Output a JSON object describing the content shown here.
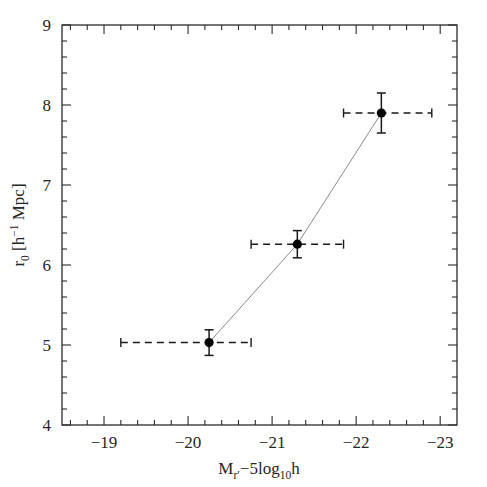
{
  "chart_data": {
    "type": "scatter",
    "title": "",
    "xlabel": "M_r' - 5log10 h",
    "ylabel": "r_0 [h^-1 Mpc]",
    "xlim": [
      -18.5,
      -23.2
    ],
    "ylim": [
      4,
      9
    ],
    "x_ticks": [
      -19,
      -20,
      -21,
      -22,
      -23
    ],
    "x_tick_labels": [
      "−19",
      "−20",
      "−21",
      "−22",
      "−23"
    ],
    "y_ticks": [
      4,
      5,
      6,
      7,
      8,
      9
    ],
    "y_tick_labels": [
      "4",
      "5",
      "6",
      "7",
      "8",
      "9"
    ],
    "x_minor_interval": 0.2,
    "y_minor_interval": 0.2,
    "grid": false,
    "legend": null,
    "series": [
      {
        "name": "r0 vs absolute magnitude",
        "line_color": "#8c8c8c",
        "marker_color": "#000000",
        "points": [
          {
            "x": -20.25,
            "y": 5.03,
            "yerr": 0.16,
            "xbin_low": -19.2,
            "xbin_high": -20.75
          },
          {
            "x": -21.3,
            "y": 6.26,
            "yerr": 0.17,
            "xbin_low": -20.75,
            "xbin_high": -21.85
          },
          {
            "x": -22.3,
            "y": 7.9,
            "yerr": 0.25,
            "xbin_low": -21.85,
            "xbin_high": -22.9
          }
        ]
      }
    ]
  },
  "axis_labels": {
    "y_main": "r",
    "y_sub": "0",
    "y_bracket_open": " [h",
    "y_sup": "−1",
    "y_unit": " Mpc]",
    "x_main": "M",
    "x_sub": "r′",
    "x_mid": "−5log",
    "x_sub2": "10",
    "x_end": "h"
  }
}
